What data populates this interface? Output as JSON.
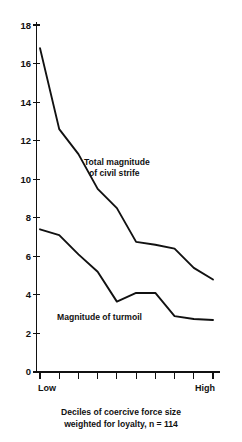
{
  "chart_data": {
    "type": "line",
    "title": "",
    "subtitle": "",
    "xlabel": "Deciles of coercive force size weighted for loyalty, n = 114",
    "ylabel": "",
    "xlim": [
      1,
      10
    ],
    "ylim": [
      0,
      18
    ],
    "grid": false,
    "legend_position": "inline-annotation",
    "categories": [
      "1",
      "2",
      "3",
      "4",
      "5",
      "6",
      "7",
      "8",
      "9",
      "10"
    ],
    "x_tick_labels": [
      "",
      "",
      "",
      "",
      "",
      "",
      "",
      "",
      "",
      ""
    ],
    "x_end_labels": {
      "left": "Low",
      "right": "High"
    },
    "y_ticks": [
      0,
      2,
      4,
      6,
      8,
      10,
      12,
      14,
      16,
      18
    ],
    "y_tick_labels": [
      "0",
      "2",
      "4",
      "6",
      "8",
      "10",
      "12",
      "14",
      "16",
      "18"
    ],
    "series": [
      {
        "name": "Total magnitude of civil strife",
        "label_line1": "Total magnitude",
        "label_line2": "of civil strife",
        "color": "#111111",
        "values": [
          16.8,
          12.6,
          11.3,
          9.5,
          8.5,
          6.75,
          6.6,
          6.4,
          5.4,
          4.8
        ]
      },
      {
        "name": "Magnitude of turmoil",
        "label_line1": "Magnitude of turmoil",
        "label_line2": "",
        "color": "#111111",
        "values": [
          7.4,
          7.1,
          6.1,
          5.2,
          3.65,
          4.1,
          4.1,
          2.9,
          2.75,
          2.7
        ]
      }
    ],
    "caption_line1": "Deciles of coercive force size",
    "caption_line2": "weighted for loyalty, n = 114"
  },
  "axis": {
    "y_label_18": "18",
    "y_label_16": "16",
    "y_label_14": "14",
    "y_label_12": "12",
    "y_label_10": "10",
    "y_label_8": "8",
    "y_label_6": "6",
    "y_label_4": "4",
    "y_label_2": "2",
    "y_label_0": "0",
    "x_label_low": "Low",
    "x_label_high": "High"
  },
  "annotations": {
    "strife_line1": "Total magnitude",
    "strife_line2": "of civil strife",
    "turmoil_line1": "Magnitude of turmoil"
  },
  "caption": {
    "line1": "Deciles of coercive force size",
    "line2": "weighted for loyalty, n = 114"
  }
}
